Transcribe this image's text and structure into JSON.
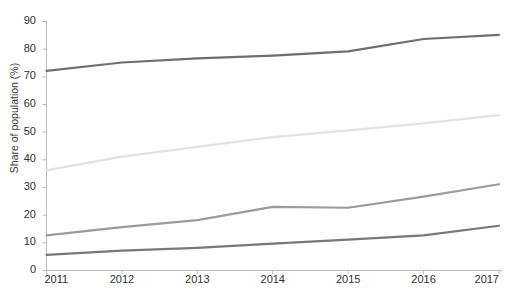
{
  "chart_data": {
    "type": "line",
    "title": "",
    "title_note": "title is cropped off the top edge of the screenshot",
    "xlabel": "",
    "ylabel": "Share of population (%)",
    "x": [
      "2011",
      "2012",
      "2013",
      "2014",
      "2015",
      "2016",
      "2017"
    ],
    "xlim": [
      2011,
      2017
    ],
    "ylim": [
      0,
      90
    ],
    "ytick_labels": [
      "90",
      "80",
      "70",
      "60",
      "50",
      "40",
      "30",
      "20",
      "10",
      "0"
    ],
    "ytick_values": [
      90,
      80,
      70,
      60,
      50,
      40,
      30,
      20,
      10,
      0
    ],
    "grid": false,
    "legend": "none",
    "series": [
      {
        "name": "series-1",
        "color": "#6e6e6e",
        "values": [
          72.0,
          75.0,
          76.5,
          77.5,
          79.0,
          83.5,
          85.0
        ]
      },
      {
        "name": "series-2",
        "color": "#e2e2e2",
        "values": [
          36.0,
          41.0,
          44.5,
          48.0,
          50.5,
          53.0,
          56.0
        ]
      },
      {
        "name": "series-3",
        "color": "#9b9b9b",
        "values": [
          12.5,
          15.5,
          18.0,
          22.8,
          22.5,
          26.5,
          31.0
        ]
      },
      {
        "name": "series-4",
        "color": "#787878",
        "values": [
          5.5,
          7.0,
          8.0,
          9.5,
          11.0,
          12.5,
          16.0
        ]
      }
    ]
  },
  "axes": {
    "y_axis_title": "Share of population (%)",
    "y_labels": [
      "90",
      "80",
      "70",
      "60",
      "50",
      "40",
      "30",
      "20",
      "10",
      "0"
    ],
    "x_labels": [
      "2011",
      "2012",
      "2013",
      "2014",
      "2015",
      "2016",
      "2017"
    ],
    "axis_color": "#b9b9b9"
  },
  "header": {
    "clipped_title": ""
  }
}
